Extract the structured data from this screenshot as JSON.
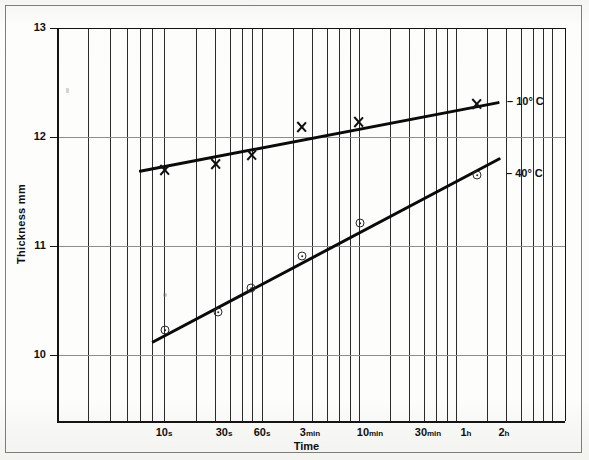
{
  "figure": {
    "background_color": "#fdfdfc",
    "frame_color": "#7d7d7d",
    "axis_color": "#141414",
    "grid_color": "#2b2b2b"
  },
  "chart_data": {
    "type": "line",
    "title": "",
    "xlabel": "Time",
    "ylabel": "Thickness   mm",
    "xscale": "log",
    "ylim": [
      9.0,
      13.0
    ],
    "yticks": [
      10,
      11,
      12,
      13
    ],
    "ytick_labels": [
      "10",
      "11",
      "12",
      "13"
    ],
    "grid": "vertical-log-major-and-minor, horizontal at integer thickness",
    "legend_position": "inline right of each curve",
    "xtick_labels": [
      {
        "value": "10",
        "unit": "s",
        "x_px": 164
      },
      {
        "value": "30",
        "unit": "s",
        "x_px": 224
      },
      {
        "value": "60",
        "unit": "s",
        "x_px": 262
      },
      {
        "value": "3",
        "unit": "min",
        "x_px": 310
      },
      {
        "value": "10",
        "unit": "min",
        "x_px": 370
      },
      {
        "value": "30",
        "unit": "min",
        "x_px": 428
      },
      {
        "value": "1",
        "unit": "h",
        "x_px": 466
      },
      {
        "value": "2",
        "unit": "h",
        "x_px": 504
      }
    ],
    "vertical_gridlines_px": [
      57,
      88,
      110,
      127,
      140,
      152,
      164,
      196,
      215,
      230,
      242,
      252,
      262,
      293,
      312,
      327,
      339,
      350,
      359,
      390,
      409,
      424,
      436,
      447,
      456,
      487,
      506,
      521,
      533,
      543,
      552,
      565
    ],
    "horizontal_gridlines": [
      {
        "label": "13",
        "y_px": 28
      },
      {
        "label": "12",
        "y_px": 137
      },
      {
        "label": "11",
        "y_px": 246
      },
      {
        "label": "10",
        "y_px": 355
      }
    ],
    "series": [
      {
        "name": "– 10° C",
        "marker": "x",
        "label_x_px": 500,
        "label_y_px": 101,
        "line": {
          "x1_px": 139,
          "y1_px": 170,
          "x2_px": 499,
          "y2_px": 101
        },
        "points": [
          {
            "x_label": "10 s",
            "x_px": 164,
            "y_px": 170,
            "thickness": 11.7
          },
          {
            "x_label": "30 s",
            "x_px": 215,
            "y_px": 164,
            "thickness": 11.75
          },
          {
            "x_label": "60 s",
            "x_px": 251,
            "y_px": 155,
            "thickness": 11.83
          },
          {
            "x_label": "3 min",
            "x_px": 301,
            "y_px": 127,
            "thickness": 12.09
          },
          {
            "x_label": "10 min",
            "x_px": 358,
            "y_px": 122,
            "thickness": 12.14
          },
          {
            "x_label": "2 h",
            "x_px": 476,
            "y_px": 104,
            "thickness": 12.3
          }
        ]
      },
      {
        "name": "– 40° C",
        "marker": "circle-dot",
        "label_x_px": 499,
        "label_y_px": 173,
        "line": {
          "x1_px": 152,
          "y1_px": 341,
          "x2_px": 500,
          "y2_px": 157
        },
        "points": [
          {
            "x_label": "10 s",
            "x_px": 165,
            "y_px": 330,
            "thickness": 10.22
          },
          {
            "x_label": "30 s",
            "x_px": 218,
            "y_px": 312,
            "thickness": 10.39
          },
          {
            "x_label": "60 s",
            "x_px": 251,
            "y_px": 288,
            "thickness": 10.61
          },
          {
            "x_label": "3 min",
            "x_px": 302,
            "y_px": 256,
            "thickness": 10.91
          },
          {
            "x_label": "10 min",
            "x_px": 360,
            "y_px": 223,
            "thickness": 11.21
          },
          {
            "x_label": "2 h",
            "x_px": 477,
            "y_px": 175,
            "thickness": 11.65
          }
        ]
      }
    ]
  }
}
